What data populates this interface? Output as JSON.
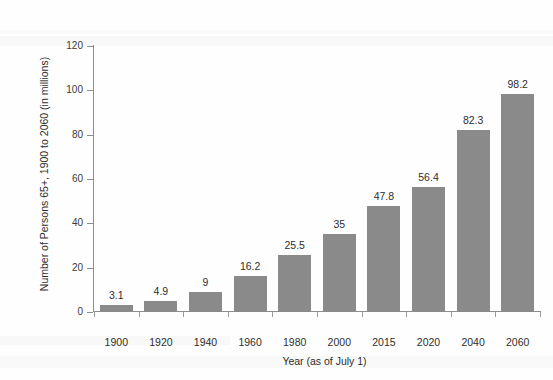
{
  "chart_data": {
    "type": "bar",
    "title": "",
    "subtitle": "",
    "xlabel": "Year (as of July 1)",
    "ylabel": "Number of Persons 65+, 1900 to 2060 (in millions)",
    "categories": [
      "1900",
      "1920",
      "1940",
      "1960",
      "1980",
      "2000",
      "2015",
      "2020",
      "2040",
      "2060"
    ],
    "values": [
      3.1,
      4.9,
      9,
      16.2,
      25.5,
      35,
      47.8,
      56.4,
      82.3,
      98.2
    ],
    "value_labels": [
      "3.1",
      "4.9",
      "9",
      "16.2",
      "25.5",
      "35",
      "47.8",
      "56.4",
      "82.3",
      "98.2"
    ],
    "series": [
      {
        "name": "Persons 65+",
        "values": [
          3.1,
          4.9,
          9,
          16.2,
          25.5,
          35,
          47.8,
          56.4,
          82.3,
          98.2
        ]
      }
    ],
    "ylim": [
      0,
      120
    ],
    "yticks": [
      0,
      20,
      40,
      60,
      80,
      100,
      120
    ],
    "ytick_labels": [
      "0",
      "20",
      "40",
      "60",
      "80",
      "100",
      "120"
    ],
    "grid": false,
    "legend": false,
    "legend_position": "none",
    "bar_color": "#8a8a8a",
    "axis_color": "#8d8d8d",
    "text_color": "#2e2e2e",
    "background_color": "#fefefe"
  }
}
